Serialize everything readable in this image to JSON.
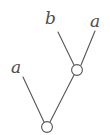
{
  "figure": {
    "kind": "tree-diagram",
    "background_color": "#ffffff",
    "stroke_color": "#555555",
    "node_fill_color": "#ffffff",
    "label_color": "#4d4d4d",
    "stroke_width": 1.1,
    "node_radius": 5.4,
    "width": 110,
    "height": 135
  },
  "nodes": [
    {
      "id": "root",
      "label": "",
      "cx": 47,
      "cy": 127
    },
    {
      "id": "internal",
      "label": "",
      "cx": 77,
      "cy": 70
    }
  ],
  "leaves": [
    {
      "id": "leaf-left-a",
      "label": "a",
      "x": 11,
      "y": 59,
      "tip_x": 23,
      "tip_y": 77
    },
    {
      "id": "leaf-b",
      "label": "b",
      "x": 45,
      "y": 10,
      "tip_x": 58,
      "tip_y": 32
    },
    {
      "id": "leaf-right-a",
      "label": "a",
      "x": 90,
      "y": 13,
      "tip_x": 95,
      "tip_y": 31
    }
  ],
  "edges": [
    {
      "id": "edge-root-leaf-left-a",
      "from": "root",
      "to": "leaf-left-a",
      "x1": 44,
      "y1": 122,
      "x2": 23,
      "y2": 77
    },
    {
      "id": "edge-root-internal",
      "from": "root",
      "to": "internal",
      "x1": 50,
      "y1": 122,
      "x2": 74,
      "y2": 75
    },
    {
      "id": "edge-internal-leaf-b",
      "from": "internal",
      "to": "leaf-b",
      "x1": 74,
      "y1": 65,
      "x2": 58,
      "y2": 32
    },
    {
      "id": "edge-internal-leaf-right-a",
      "from": "internal",
      "to": "leaf-right-a",
      "x1": 81,
      "y1": 65,
      "x2": 95,
      "y2": 31
    }
  ]
}
